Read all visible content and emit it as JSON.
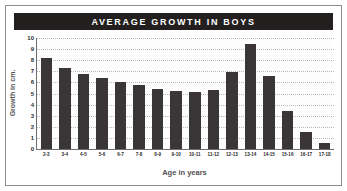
{
  "chart_data": {
    "type": "bar",
    "title": "AVERAGE GROWTH IN BOYS",
    "xlabel": "Age in years",
    "ylabel": "Growth in cm.",
    "categories": [
      "2-3",
      "3-4",
      "4-5",
      "5-6",
      "6-7",
      "7-8",
      "8-9",
      "9-10",
      "10-11",
      "11-12",
      "12-13",
      "13-14",
      "14-15",
      "15-16",
      "16-17",
      "17-18"
    ],
    "values": [
      8.2,
      7.3,
      6.8,
      6.4,
      6.0,
      5.8,
      5.4,
      5.2,
      5.1,
      5.3,
      6.9,
      9.5,
      6.6,
      3.4,
      1.5,
      0.5
    ],
    "ytick_labels": [
      "0",
      "1",
      "2",
      "3",
      "4",
      "5",
      "6",
      "7",
      "8",
      "9",
      "10"
    ],
    "ytick_values": [
      0,
      1,
      2,
      3,
      4,
      5,
      6,
      7,
      8,
      9,
      10
    ],
    "ylim": [
      0,
      10
    ],
    "grid": true,
    "legend": false,
    "bar_color": "#3a3637",
    "title_bg_color": "#231f1f",
    "title_text_color": "#ffffff",
    "axis_color": "#6d6d6d",
    "grid_color": "#b9b9b9",
    "plot_bg_color": "#fdfdfd",
    "frame_color": "#8e8e8e"
  }
}
